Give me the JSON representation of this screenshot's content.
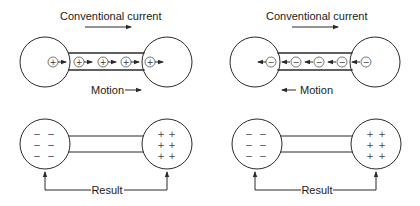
{
  "panels": [
    {
      "id": "positive-carriers",
      "title": "Conventional current",
      "motion_label": "Motion",
      "motion_direction": "right",
      "current_direction": "right",
      "carrier_symbol": "+"
    },
    {
      "id": "negative-carriers",
      "title": "Conventional current",
      "motion_label": "Motion",
      "motion_direction": "left",
      "current_direction": "right",
      "carrier_symbol": "−"
    }
  ],
  "results": [
    {
      "label": "Result",
      "left_sphere_charge": "−",
      "right_sphere_charge": "+"
    },
    {
      "label": "Result",
      "left_sphere_charge": "−",
      "right_sphere_charge": "+"
    }
  ],
  "colors": {
    "line": "#2a2a2a",
    "background": "#ffffff"
  }
}
